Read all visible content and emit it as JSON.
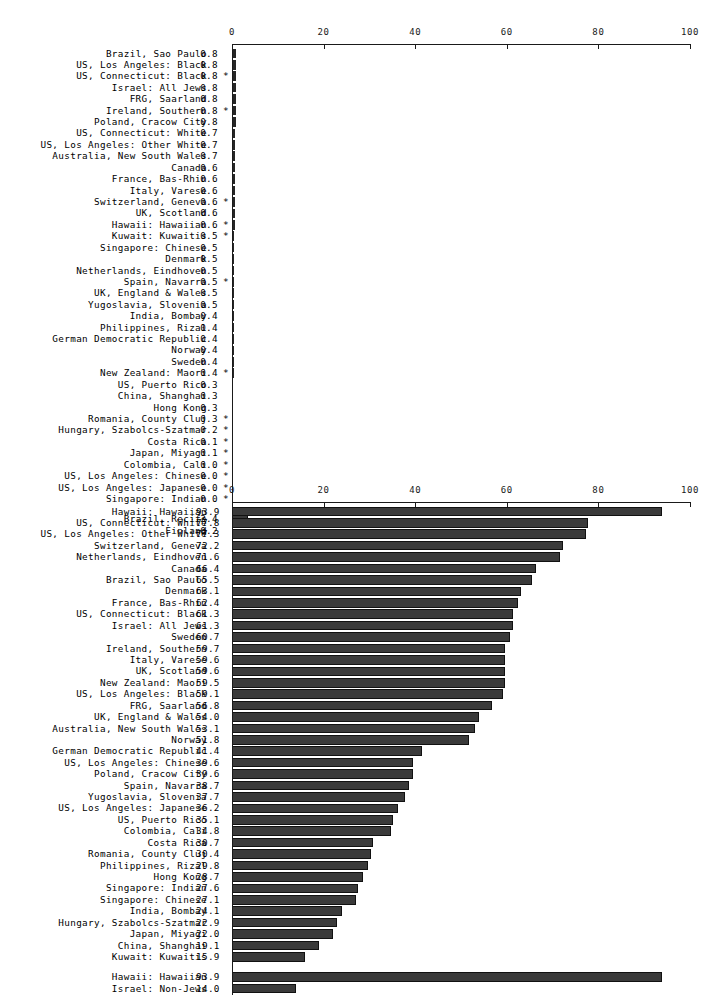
{
  "chart_data": [
    {
      "id": "chart-top",
      "type": "bar",
      "orientation": "horizontal",
      "title": "",
      "xlabel": "",
      "ylabel": "",
      "xlim": [
        0,
        100
      ],
      "xticks": [
        0,
        20,
        40,
        60,
        80,
        100
      ],
      "grid": false,
      "legend": "none",
      "star_symbol": "*",
      "categories": [
        "Brazil, Sao Paulo",
        "US, Los Angeles: Black",
        "US, Connecticut: Black",
        "Israel: All Jews",
        "FRG, Saarland",
        "Ireland, Southern",
        "Poland, Cracow City",
        "US, Connecticut: White",
        "US, Los Angeles: Other White",
        "Australia, New South Wales",
        "Canada",
        "France, Bas-Rhin",
        "Italy, Varese",
        "Switzerland, Geneva",
        "UK, Scotland",
        "Hawaii: Hawaiian",
        "Kuwait: Kuwaitis",
        "Singapore: Chinese",
        "Denmark",
        "Netherlands, Eindhoven",
        "Spain, Navarra",
        "UK, England & Wales",
        "Yugoslavia, Slovenia",
        "India, Bombay",
        "Philippines, Rizal",
        "German Democratic Republic",
        "Norway",
        "Sweden",
        "New Zealand: Maori",
        "US, Puerto Rico",
        "China, Shanghai",
        "Hong Kong",
        "Romania, County Cluj",
        "Hungary, Szabolcs-Szatmar",
        "Costa Rica",
        "Japan, Miyagi",
        "Colombia, Cali",
        "US, Los Angeles: Chinese",
        "US, Los Angeles: Japanese",
        "Singapore: Indian",
        "Brazil, Recife",
        "Finland"
      ],
      "value_labels": [
        "0.8",
        "0.8",
        "0.8",
        "0.8",
        "0.8",
        "0.8",
        "0.8",
        "0.7",
        "0.7",
        "0.7",
        "0.6",
        "0.6",
        "0.6",
        "0.6",
        "0.6",
        "0.6",
        "0.5",
        "0.5",
        "0.5",
        "0.5",
        "0.5",
        "0.5",
        "0.5",
        "0.4",
        "0.4",
        "0.4",
        "0.4",
        "0.4",
        "0.4",
        "0.3",
        "0.3",
        "0.3",
        "0.3",
        "0.2",
        "0.1",
        "0.1",
        "0.0",
        "0.0",
        "0.0",
        "0.0",
        "3.4",
        "0.2"
      ],
      "values": [
        0.8,
        0.8,
        0.8,
        0.8,
        0.8,
        0.8,
        0.8,
        0.7,
        0.7,
        0.7,
        0.6,
        0.6,
        0.6,
        0.6,
        0.6,
        0.6,
        0.5,
        0.5,
        0.5,
        0.5,
        0.5,
        0.5,
        0.5,
        0.4,
        0.4,
        0.4,
        0.4,
        0.4,
        0.4,
        0.3,
        0.3,
        0.3,
        0.3,
        0.2,
        0.1,
        0.1,
        0.0,
        0.0,
        0.0,
        0.0,
        3.4,
        0.2
      ],
      "starred": [
        false,
        false,
        true,
        false,
        false,
        true,
        false,
        false,
        false,
        false,
        false,
        false,
        false,
        true,
        false,
        true,
        true,
        false,
        false,
        false,
        true,
        false,
        false,
        false,
        false,
        false,
        false,
        false,
        true,
        false,
        false,
        false,
        true,
        true,
        true,
        true,
        true,
        true,
        true,
        true,
        false,
        false
      ],
      "group_break_before_index": 40
    },
    {
      "id": "chart-bottom",
      "type": "bar",
      "orientation": "horizontal",
      "title": "",
      "xlabel": "",
      "ylabel": "",
      "xlim": [
        0,
        100
      ],
      "xticks": [
        0,
        20,
        40,
        60,
        80,
        100
      ],
      "grid": false,
      "legend": "none",
      "star_symbol": "*",
      "categories": [
        "Hawaii: Hawaiian",
        "US, Connecticut: White",
        "US, Los Angeles: Other White",
        "Switzerland, Geneva",
        "Netherlands, Eindhoven",
        "Canada",
        "Brazil, Sao Paulo",
        "Denmark",
        "France, Bas-Rhin",
        "US, Connecticut: Black",
        "Israel: All Jews",
        "Sweden",
        "Ireland, Southern",
        "Italy, Varese",
        "UK, Scotland",
        "New Zealand: Maori",
        "US, Los Angeles: Black",
        "FRG, Saarland",
        "UK, England & Wales",
        "Australia, New South Wales",
        "Norway",
        "German Democratic Republic",
        "US, Los Angeles: Chinese",
        "Poland, Cracow City",
        "Spain, Navarra",
        "Yugoslavia, Slovenia",
        "US, Los Angeles: Japanese",
        "US, Puerto Rico",
        "Colombia, Cali",
        "Costa Rica",
        "Romania, County Cluj",
        "Philippines, Rizal",
        "Hong Kong",
        "Singapore: Indian",
        "Singapore: Chinese",
        "India, Bombay",
        "Hungary, Szabolcs-Szatmar",
        "Japan, Miyagi",
        "China, Shanghai",
        "Kuwait: Kuwaitis",
        "Hawaii: Hawaiian",
        "Israel: Non-Jews"
      ],
      "value_labels": [
        "93.9",
        "77.8",
        "77.3",
        "72.2",
        "71.6",
        "66.4",
        "65.5",
        "63.1",
        "62.4",
        "61.3",
        "61.3",
        "60.7",
        "59.7",
        "59.6",
        "59.6",
        "59.5",
        "59.1",
        "56.8",
        "54.0",
        "53.1",
        "51.8",
        "41.4",
        "39.6",
        "39.6",
        "38.7",
        "37.7",
        "36.2",
        "35.1",
        "34.8",
        "30.7",
        "30.4",
        "29.8",
        "28.7",
        "27.6",
        "27.1",
        "24.1",
        "22.9",
        "22.0",
        "19.1",
        "15.9",
        "93.9",
        "14.0"
      ],
      "values": [
        93.9,
        77.8,
        77.3,
        72.2,
        71.6,
        66.4,
        65.5,
        63.1,
        62.4,
        61.3,
        61.3,
        60.7,
        59.7,
        59.6,
        59.6,
        59.5,
        59.1,
        56.8,
        54.0,
        53.1,
        51.8,
        41.4,
        39.6,
        39.6,
        38.7,
        37.7,
        36.2,
        35.1,
        34.8,
        30.7,
        30.4,
        29.8,
        28.7,
        27.6,
        27.1,
        24.1,
        22.9,
        22.0,
        19.1,
        15.9,
        93.9,
        14.0
      ],
      "starred": [
        false,
        false,
        false,
        false,
        false,
        false,
        false,
        false,
        false,
        false,
        false,
        false,
        false,
        false,
        false,
        false,
        false,
        false,
        false,
        false,
        false,
        false,
        false,
        false,
        false,
        false,
        false,
        false,
        false,
        false,
        false,
        false,
        false,
        false,
        false,
        false,
        false,
        false,
        false,
        false,
        false,
        false
      ],
      "group_break_before_index": 40
    }
  ]
}
